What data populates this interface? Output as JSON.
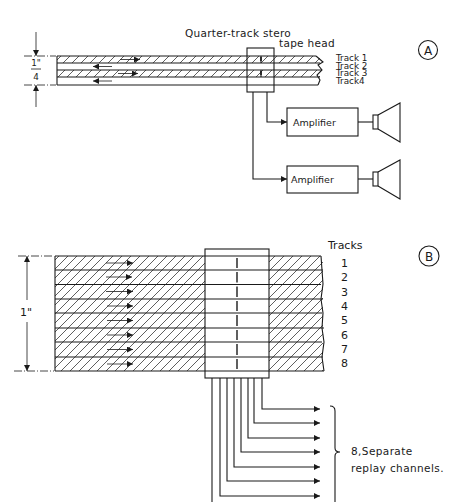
{
  "panel_a": {
    "label": "A",
    "head_label_line1": "Quarter-track stero",
    "head_label_line2": "tape head",
    "dimension": {
      "numerator": "1\"",
      "denominator": "4"
    },
    "tracks": [
      "Track 1",
      "Track 2",
      "Track 3",
      "Track4"
    ],
    "amplifiers": [
      "Amplifier",
      "Amplifier"
    ]
  },
  "panel_b": {
    "label": "B",
    "tracks_header": "Tracks",
    "track_numbers": [
      "1",
      "2",
      "3",
      "4",
      "5",
      "6",
      "7",
      "8"
    ],
    "dimension": "1\"",
    "caption_line1": "8,Separate",
    "caption_line2": "replay channels."
  },
  "colors": {
    "ink": "#1a1a1a",
    "paper": "#ffffff"
  }
}
